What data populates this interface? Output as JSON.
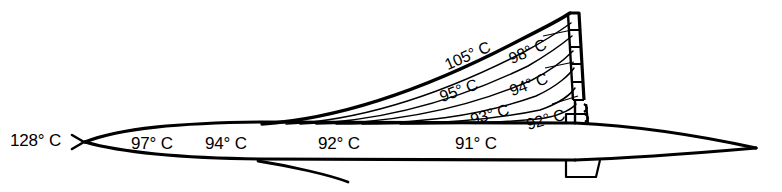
{
  "diagram": {
    "units": "degrees Celsius",
    "background_color": "#ffffff",
    "line_color": "#000000",
    "degree_symbol": "°"
  },
  "labels": [
    {
      "id": "nose-tip",
      "text": "128° C",
      "value": 128,
      "x": 10,
      "y": 132,
      "size": 17,
      "rotate": 0,
      "region": "nose-tip"
    },
    {
      "id": "forward-fuselage",
      "text": "97° C",
      "value": 97,
      "x": 131,
      "y": 135,
      "size": 17,
      "rotate": 0,
      "region": "forward-fuselage"
    },
    {
      "id": "fuselage-2",
      "text": "94° C",
      "value": 94,
      "x": 205,
      "y": 135,
      "size": 17,
      "rotate": 0,
      "region": "forward-fuselage"
    },
    {
      "id": "mid-fuselage",
      "text": "92° C",
      "value": 92,
      "x": 318,
      "y": 135,
      "size": 17,
      "rotate": 0,
      "region": "mid-fuselage"
    },
    {
      "id": "aft-fuselage",
      "text": "91° C",
      "value": 91,
      "x": 455,
      "y": 135,
      "size": 17,
      "rotate": 0,
      "region": "aft-fuselage"
    },
    {
      "id": "fin-leading-edge",
      "text": "105° C",
      "value": 105,
      "x": 449,
      "y": 57,
      "size": 16,
      "rotate": -24,
      "region": "fin-leading-edge"
    },
    {
      "id": "fin-upper-aft",
      "text": "98° C",
      "value": 98,
      "x": 513,
      "y": 51,
      "size": 16,
      "rotate": -24,
      "region": "fin-upper-aft"
    },
    {
      "id": "fin-mid-forward",
      "text": "95° C",
      "value": 95,
      "x": 443,
      "y": 89,
      "size": 16,
      "rotate": -20,
      "region": "fin-mid-forward"
    },
    {
      "id": "fin-mid-aft",
      "text": "94° C",
      "value": 94,
      "x": 513,
      "y": 83,
      "size": 16,
      "rotate": -20,
      "region": "fin-mid-aft"
    },
    {
      "id": "fin-lower-fwd",
      "text": "93° C",
      "value": 93,
      "x": 473,
      "y": 112,
      "size": 16,
      "rotate": -16,
      "region": "fin-lower-forward"
    },
    {
      "id": "fin-lower-aft",
      "text": "92° C",
      "value": 92,
      "x": 529,
      "y": 117,
      "size": 16,
      "rotate": -16,
      "region": "fin-lower-aft"
    }
  ],
  "geometry": {
    "fuselage_top_y": 124,
    "fuselage_bottom_y": 160,
    "nose_tip": {
      "x": 85,
      "y": 142
    },
    "tail_tip": {
      "x": 756,
      "y": 148
    }
  }
}
